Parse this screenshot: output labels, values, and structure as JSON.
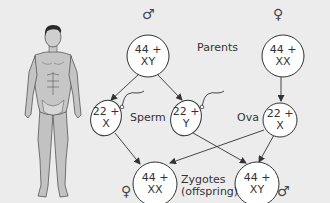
{
  "diagram": {
    "colors": {
      "background": "#ececec",
      "stroke": "#333333",
      "cell_fill": "#ffffff",
      "body_fill": "#bdbdbd"
    },
    "labels": {
      "parents": "Parents",
      "sperm": "Sperm",
      "ova": "Ova",
      "zygotes_line1": "Zygotes",
      "zygotes_line2": "(offspring)"
    },
    "symbols": {
      "male": "♂",
      "female": "♀"
    },
    "nodes": {
      "male_parent": {
        "line1": "44 +",
        "line2": "XY",
        "sex_symbol": "♂"
      },
      "female_parent": {
        "line1": "44 +",
        "line2": "XX",
        "sex_symbol": "♀"
      },
      "sperm_x": {
        "line1": "22 +",
        "line2": "X"
      },
      "sperm_y": {
        "line1": "22 +",
        "line2": "Y"
      },
      "ovum_x": {
        "line1": "22 +",
        "line2": "X"
      },
      "zygote_female": {
        "line1": "44 +",
        "line2": "XX",
        "sex_symbol": "♀"
      },
      "zygote_male": {
        "line1": "44 +",
        "line2": "XY",
        "sex_symbol": "♂"
      }
    },
    "edges": [
      {
        "from": "male_parent",
        "to": "sperm_x"
      },
      {
        "from": "male_parent",
        "to": "sperm_y"
      },
      {
        "from": "female_parent",
        "to": "ovum_x"
      },
      {
        "from": "sperm_x",
        "to": "zygote_female"
      },
      {
        "from": "ovum_x",
        "to": "zygote_female"
      },
      {
        "from": "sperm_y",
        "to": "zygote_male"
      },
      {
        "from": "ovum_x",
        "to": "zygote_male"
      }
    ]
  }
}
